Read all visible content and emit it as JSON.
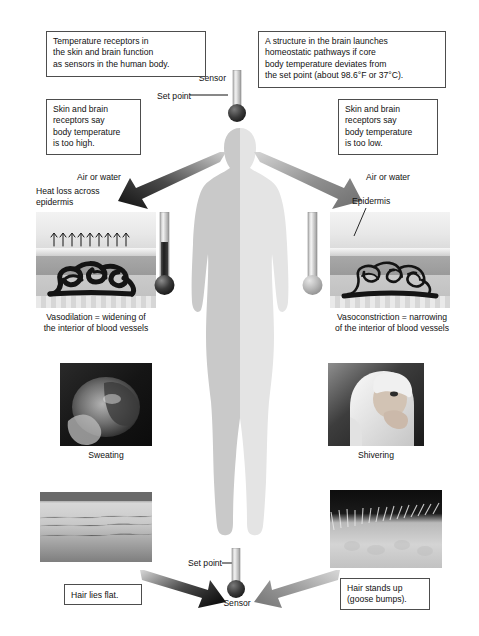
{
  "diagram": {
    "type": "biology-process-diagram"
  },
  "callouts": {
    "top_left": "Temperature receptors in\nthe skin and brain function\nas sensors in the human body.",
    "top_right": "A structure in the brain launches\nhomeostatic pathways if core\nbody temperature deviates from\nthe set point (about 98.6°F or 37°C).",
    "mid_left": "Skin and brain\nreceptors say\nbody temperature\nis too high.",
    "mid_right": "Skin and brain\nreceptors say\nbody temperature\nis too low.",
    "bottom_left": "Hair lies flat.",
    "bottom_right": "Hair stands up\n(goose bumps)."
  },
  "sensors": {
    "top_sensor_label": "Sensor",
    "top_setpoint_label": "Set point",
    "bottom_sensor_label": "Sensor",
    "bottom_setpoint_label": "Set point"
  },
  "left_panel": {
    "medium_label": "Air or water",
    "heat_label": "Heat loss across\nepidermis",
    "caption": "Vasodilation = widening of\nthe interior of blood vessels",
    "photo_caption": "Sweating",
    "thermometer_state": "hot"
  },
  "right_panel": {
    "medium_label": "Air or water",
    "epidermis_label": "Epidermis",
    "caption": "Vasoconstriction = narrowing\nof the interior of blood vessels",
    "photo_caption": "Shivering",
    "thermometer_state": "cold"
  },
  "colors": {
    "background": "#ffffff",
    "box_border": "#4d4d4d",
    "text": "#111111",
    "body_left": "#c9c9c9",
    "body_right": "#e2e2e2",
    "vessel": "#1a1a1a",
    "thermo_hot": "#2f2f2f",
    "thermo_cold": "#b5b5b5"
  }
}
